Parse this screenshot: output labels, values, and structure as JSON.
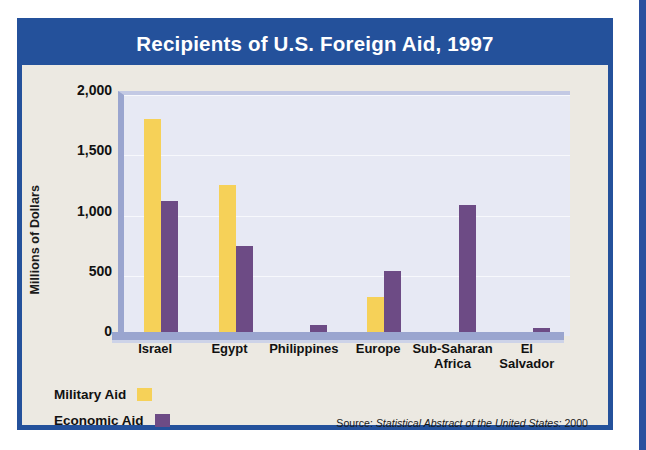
{
  "figure": {
    "title": "Recipients of U.S. Foreign Aid, 1997",
    "source_prefix": "Source:",
    "source_italic": "Statistical Abstract of the United States:",
    "source_year": "2000",
    "title_bar_color": "#24519b",
    "frame_color": "#24519b",
    "plot_background": "#e7e9f4",
    "paper_background": "#ece9e2"
  },
  "legend": {
    "military_label": "Military Aid",
    "economic_label": "Economic Aid",
    "military_color": "#f6d158",
    "economic_color": "#6d4b85"
  },
  "chart_data": {
    "type": "bar",
    "title": "Recipients of U.S. Foreign Aid, 1997",
    "xlabel": "",
    "ylabel": "Millions of Dollars",
    "categories": [
      "Israel",
      "Egypt",
      "Philippines",
      "Europe",
      "Sub-Saharan Africa",
      "El Salvador"
    ],
    "category_lines": [
      [
        "Israel"
      ],
      [
        "Egypt"
      ],
      [
        "Philippines"
      ],
      [
        "Europe"
      ],
      [
        "Sub-Saharan",
        "Africa"
      ],
      [
        "El",
        "Salvador"
      ]
    ],
    "series": [
      {
        "name": "Military Aid",
        "color": "#f6d158",
        "values": [
          1800,
          1250,
          30,
          320,
          25,
          20
        ]
      },
      {
        "name": "Economic Aid",
        "color": "#6d4b85",
        "values": [
          1120,
          750,
          90,
          540,
          1090,
          70
        ]
      }
    ],
    "ylim": [
      0,
      2000
    ],
    "yticks": [
      2000,
      1500,
      1000,
      500,
      0
    ],
    "ytick_labels": [
      "2,000",
      "1,500",
      "1,000",
      "500",
      "0"
    ],
    "grid": true,
    "legend_position": "bottom-left"
  }
}
